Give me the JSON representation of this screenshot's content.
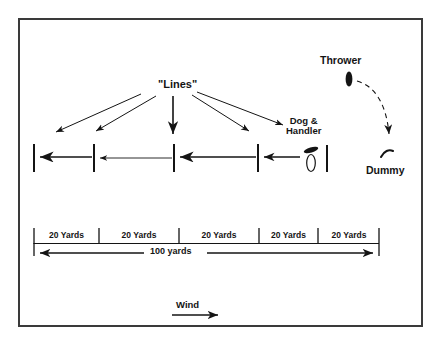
{
  "diagram": {
    "title_labels": {
      "lines": "\"Lines\"",
      "thrower": "Thrower",
      "dummy": "Dummy",
      "dog_handler_line1": "Dog &",
      "dog_handler_line2": "Handler",
      "wind": "Wind"
    },
    "scale": {
      "segments": [
        {
          "label": "20 Yards"
        },
        {
          "label": "20 Yards"
        },
        {
          "label": "20 Yards"
        },
        {
          "label": "20 Yards"
        },
        {
          "label": "20 Yards"
        }
      ],
      "total_label": "100  yards"
    },
    "colors": {
      "ink": "#141414",
      "frame": "#3a3a3a",
      "background": "#ffffff"
    }
  }
}
